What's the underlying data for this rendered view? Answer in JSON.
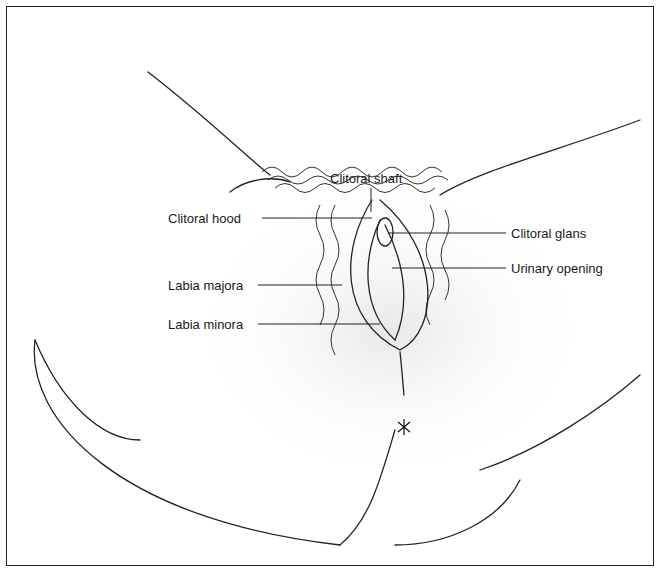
{
  "diagram": {
    "type": "anatomical-illustration",
    "labels": {
      "top": "Clitoral shaft",
      "left": [
        "Clitoral hood",
        "Labia majora",
        "Labia minora"
      ],
      "right": [
        "Clitoral glans",
        "Urinary opening"
      ]
    }
  }
}
